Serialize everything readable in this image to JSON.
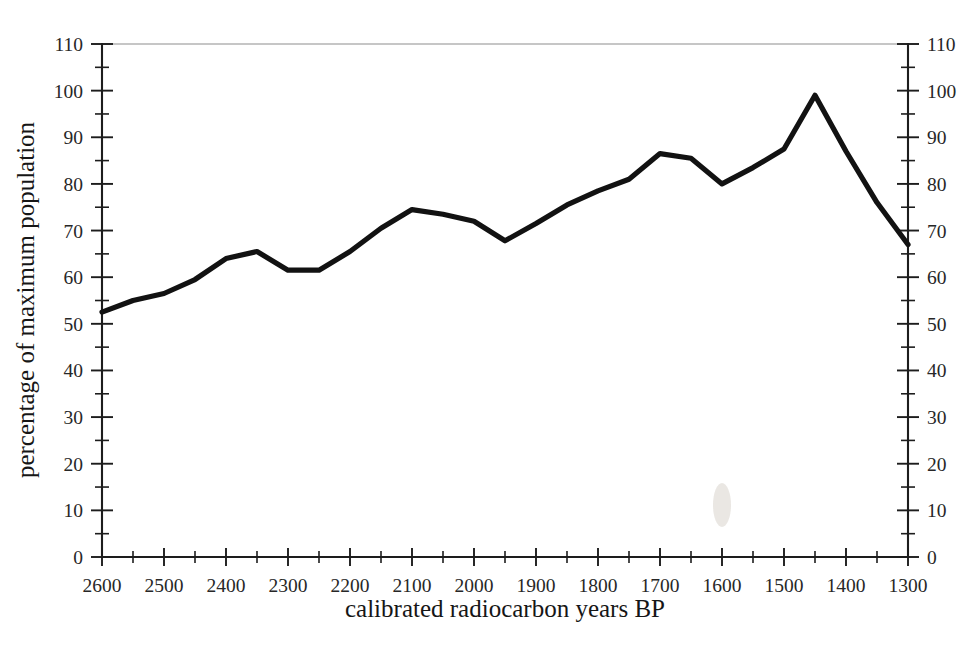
{
  "chart_data": {
    "type": "line",
    "title": "",
    "xlabel": "calibrated radiocarbon years BP",
    "ylabel": "percentage of maximum population",
    "xlim": [
      2600,
      1300
    ],
    "ylim": [
      0,
      110
    ],
    "x_axis_reversed": true,
    "grid": false,
    "legend": null,
    "x_tick_labels": [
      "2600",
      "2500",
      "2400",
      "2300",
      "2200",
      "2100",
      "2000",
      "1900",
      "1800",
      "1700",
      "1600",
      "1500",
      "1400",
      "1300"
    ],
    "x_tick_values": [
      2600,
      2500,
      2400,
      2300,
      2200,
      2100,
      2000,
      1900,
      1800,
      1700,
      1600,
      1500,
      1400,
      1300
    ],
    "x_minor_step": 50,
    "y_tick_labels_left": [
      "0",
      "10",
      "20",
      "30",
      "40",
      "50",
      "60",
      "70",
      "80",
      "90",
      "100",
      "110"
    ],
    "y_tick_labels_right": [
      "0",
      "10",
      "20",
      "30",
      "40",
      "50",
      "60",
      "70",
      "80",
      "90",
      "100",
      "110"
    ],
    "y_tick_values": [
      0,
      10,
      20,
      30,
      40,
      50,
      60,
      70,
      80,
      90,
      100,
      110
    ],
    "y_minor_step": 5,
    "series": [
      {
        "name": "percentage of maximum population",
        "color": "#121212",
        "x": [
          2600,
          2550,
          2500,
          2450,
          2400,
          2350,
          2300,
          2250,
          2200,
          2150,
          2100,
          2050,
          2000,
          1950,
          1900,
          1850,
          1800,
          1750,
          1700,
          1650,
          1600,
          1550,
          1500,
          1450,
          1400,
          1350,
          1300
        ],
        "values": [
          52.5,
          55.0,
          56.5,
          59.5,
          64.0,
          65.5,
          61.5,
          61.5,
          65.5,
          70.5,
          74.5,
          73.5,
          72.0,
          67.8,
          71.5,
          75.5,
          78.5,
          81.0,
          86.5,
          85.5,
          80.0,
          83.5,
          87.5,
          99.0,
          87.0,
          76.0,
          67.0
        ]
      }
    ]
  },
  "axes": {
    "x_title": "calibrated radiocarbon years BP",
    "y_title": "percentage of maximum population"
  }
}
